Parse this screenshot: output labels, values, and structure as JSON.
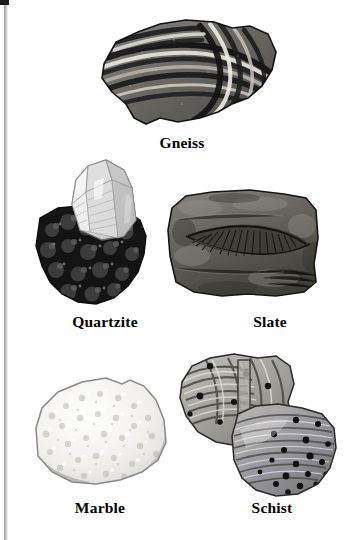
{
  "page": {
    "background_color": "#ffffff",
    "width": 348,
    "height": 540,
    "scan_edge_color": "#9a9a9a",
    "text_color": "#000000"
  },
  "figure": {
    "kind": "rock-specimen-plate",
    "category": "metamorphic rocks",
    "specimen_count": 5
  },
  "specimens": [
    {
      "id": "gneiss",
      "label": "Gneiss",
      "row": 1,
      "column": "center",
      "description": "banded folded rock with alternating dark and light layers",
      "tone": "dark-banded",
      "colors": {
        "dark": "#1d1d1d",
        "mid": "#6e6e6e",
        "light": "#e6e3dd"
      }
    },
    {
      "id": "quartzite",
      "label": "Quartzite",
      "row": 2,
      "column": "left",
      "description": "clear hexagonal quartz crystal on dark granular matrix",
      "tone": "crystal-on-dark-matrix",
      "colors": {
        "dark": "#141414",
        "mid": "#8d8d8d",
        "light": "#f1f1f1"
      }
    },
    {
      "id": "slate",
      "label": "Slate",
      "row": 2,
      "column": "right",
      "description": "flat rectangular slab bearing a fan shaped fossil impression",
      "tone": "medium-gray-slab",
      "colors": {
        "dark": "#2a2a2a",
        "mid": "#6d6a66",
        "light": "#a7a39c"
      }
    },
    {
      "id": "marble",
      "label": "Marble",
      "row": 3,
      "column": "left",
      "description": "pale rounded rock with sugary granular crystalline texture",
      "tone": "very-light",
      "colors": {
        "dark": "#9a9a96",
        "mid": "#d8d7d2",
        "light": "#fafaf8"
      }
    },
    {
      "id": "schist",
      "label": "Schist",
      "row": 3,
      "column": "right",
      "description": "two overlapping foliated specimens with dark garnet spots",
      "tone": "mid-gray-foliated",
      "colors": {
        "dark": "#262626",
        "mid": "#8b8b8b",
        "light": "#d5d4d0"
      }
    }
  ],
  "labels": {
    "gneiss": "Gneiss",
    "quartzite": "Quartzite",
    "slate": "Slate",
    "marble": "Marble",
    "schist": "Schist"
  }
}
